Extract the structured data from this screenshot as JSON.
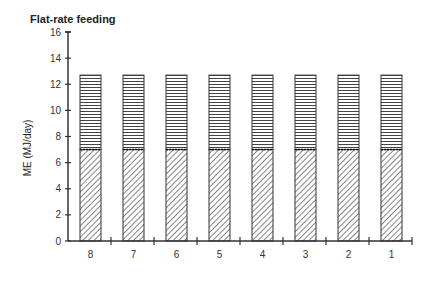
{
  "chart_data": {
    "type": "bar",
    "stacked": true,
    "title": "Flat-rate feeding",
    "xlabel": "",
    "ylabel": "ME (MJ/day)",
    "ylim": [
      0,
      16
    ],
    "yticks": [
      0,
      2,
      4,
      6,
      8,
      10,
      12,
      14,
      16
    ],
    "categories": [
      "8",
      "7",
      "6",
      "5",
      "4",
      "3",
      "2",
      "1"
    ],
    "series": [
      {
        "name": "lower (diagonal hatch)",
        "pattern": "diagonal",
        "values": [
          7.0,
          7.0,
          7.0,
          7.0,
          7.0,
          7.0,
          7.0,
          7.0
        ]
      },
      {
        "name": "upper (horizontal hatch)",
        "pattern": "horizontal",
        "values": [
          5.7,
          5.7,
          5.7,
          5.7,
          5.7,
          5.7,
          5.7,
          5.7
        ]
      }
    ],
    "totals": [
      12.7,
      12.7,
      12.7,
      12.7,
      12.7,
      12.7,
      12.7,
      12.7
    ],
    "grid": false,
    "legend": null
  },
  "colors": {
    "ink": "#333333",
    "background": "#ffffff"
  }
}
